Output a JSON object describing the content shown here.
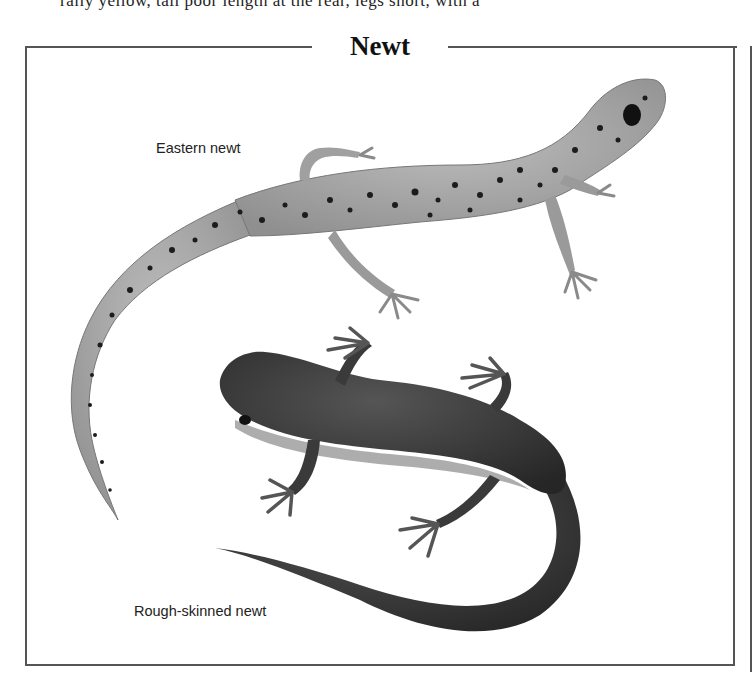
{
  "page": {
    "cut_off_text": "rally yellow, tail poor length at the rear, legs short, with a",
    "panel_title": "Newt",
    "labels": {
      "eastern": "Eastern newt",
      "rough": "Rough-skinned newt"
    }
  },
  "colors": {
    "frame": "#555555",
    "eastern_body": "#a9a9a9",
    "eastern_spots": "#1c1c1c",
    "rough_body": "#3a3a3a",
    "rough_belly": "#8a8a8a"
  }
}
